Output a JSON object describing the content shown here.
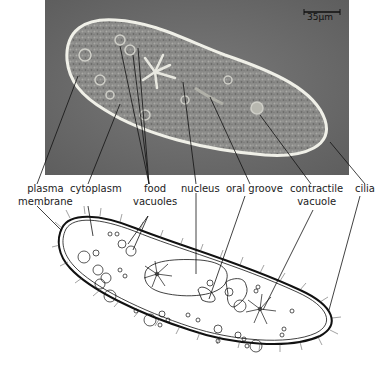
{
  "figure": {
    "scale_bar": "35µm",
    "photo_bg": "#6e6e6e",
    "labels": [
      {
        "id": "plasma-membrane",
        "line1": "plasma",
        "line2": "membrane"
      },
      {
        "id": "cytoplasm",
        "line1": "cytoplasm",
        "line2": ""
      },
      {
        "id": "food-vacuoles",
        "line1": "food",
        "line2": "vacuoles"
      },
      {
        "id": "nucleus",
        "line1": "nucleus",
        "line2": ""
      },
      {
        "id": "oral-groove",
        "line1": "oral groove",
        "line2": ""
      },
      {
        "id": "contractile-vacuole",
        "line1": "contractile",
        "line2": "vacuole"
      },
      {
        "id": "cilia",
        "line1": "cilia",
        "line2": ""
      }
    ]
  }
}
